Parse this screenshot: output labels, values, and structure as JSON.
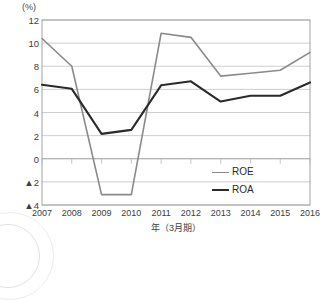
{
  "chart_data": {
    "type": "line",
    "title": "",
    "unit_label": "(%)",
    "xlabel": "年（3月期）",
    "ylabel": "",
    "categories": [
      "2007",
      "2008",
      "2009",
      "2010",
      "2011",
      "2012",
      "2013",
      "2014",
      "2015",
      "2016"
    ],
    "x": [
      2007,
      2008,
      2009,
      2010,
      2011,
      2012,
      2013,
      2014,
      2015,
      2016
    ],
    "ylim": [
      -4,
      12
    ],
    "xlim": [
      2007,
      2016
    ],
    "yticks": [
      12,
      10,
      8,
      6,
      4,
      2,
      0,
      -2,
      -4
    ],
    "ytick_labels": [
      "12",
      "10",
      "8",
      "6",
      "4",
      "2",
      "0",
      "▲2",
      "▲4"
    ],
    "grid": true,
    "grid_axis": "y",
    "legend_position": "inside-lower-right",
    "series": [
      {
        "name": "ROE",
        "color": "#8a8a8a",
        "values": [
          10.4,
          8.0,
          -3.1,
          -3.1,
          10.85,
          10.5,
          7.15,
          7.4,
          7.65,
          9.2
        ]
      },
      {
        "name": "ROA",
        "color": "#2b2b2b",
        "values": [
          6.4,
          6.05,
          2.15,
          2.5,
          6.35,
          6.7,
          4.95,
          5.45,
          5.45,
          6.6
        ]
      }
    ]
  },
  "colors": {
    "roe_line": "#8a8a8a",
    "roa_line": "#2b2b2b",
    "grid": "#b9b9b9",
    "frame": "#9a9a9a",
    "zero_line": "#8f8f8f",
    "text": "#3d3d3d",
    "background": "#ffffff"
  }
}
